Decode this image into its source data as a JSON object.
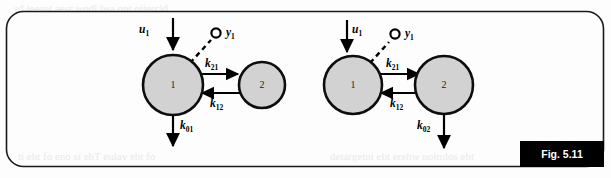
{
  "figure": {
    "tag": "Fig. 5.11",
    "panel": {
      "shape": "rounded-rectangle",
      "border_color": "#1a1a1a",
      "background_color": "#fdfdfd"
    },
    "colors": {
      "node_fill": "#d2d2d2",
      "node_stroke": "#0d0d0d",
      "arrow": "#000000",
      "tag_background": "#000000",
      "tag_text": "#ffffff"
    },
    "diagrams": [
      {
        "id": "left-model",
        "name": "two-compartment-model-elimination-from-compartment-1",
        "nodes": [
          {
            "id": "n1",
            "label": "1",
            "cx": 173,
            "cy": 85,
            "r": 30
          },
          {
            "id": "n2",
            "label": "2",
            "cx": 262,
            "cy": 85,
            "r": 23
          }
        ],
        "input": {
          "label": "u",
          "subscript": "1",
          "target": "n1"
        },
        "output": {
          "label": "y",
          "subscript": "1",
          "source": "n1",
          "style": "dashed"
        },
        "transfers": [
          {
            "label": "k",
            "subscript": "21",
            "from": "n1",
            "to": "n2"
          },
          {
            "label": "k",
            "subscript": "12",
            "from": "n2",
            "to": "n1"
          }
        ],
        "elimination": {
          "label": "k",
          "subscript": "01",
          "from": "n1"
        }
      },
      {
        "id": "right-model",
        "name": "two-compartment-model-elimination-from-compartment-2",
        "nodes": [
          {
            "id": "n1",
            "label": "1",
            "cx": 353,
            "cy": 85,
            "r": 29
          },
          {
            "id": "n2",
            "label": "2",
            "cx": 444,
            "cy": 85,
            "r": 29
          }
        ],
        "input": {
          "label": "u",
          "subscript": "1",
          "target": "n1"
        },
        "output": {
          "label": "y",
          "subscript": "1",
          "source": "n1",
          "style": "dashed"
        },
        "transfers": [
          {
            "label": "k",
            "subscript": "21",
            "from": "n1",
            "to": "n2"
          },
          {
            "label": "k",
            "subscript": "12",
            "from": "n2",
            "to": "n1"
          }
        ],
        "elimination": {
          "label": "k",
          "subscript": "02",
          "from": "n2"
        }
      }
    ]
  },
  "labels": {
    "u1_base": "u",
    "u1_sub": "1",
    "y1_base": "y",
    "y1_sub": "1",
    "k21_base": "k",
    "k21_sub": "21",
    "k12_base": "k",
    "k12_sub": "12",
    "k01_base": "k",
    "k01_sub": "01",
    "k02_base": "k",
    "k02_sub": "02",
    "node1": "1",
    "node2": "2"
  },
  "bleed": {
    "top": "sd ieesnt aesr wodl  hsa ont oitercid",
    "bottom_left": "ti eht fo eno si ehT  eulav eht fo",
    "bottom_right": "detargetni eht erehw  noitulos eht"
  }
}
